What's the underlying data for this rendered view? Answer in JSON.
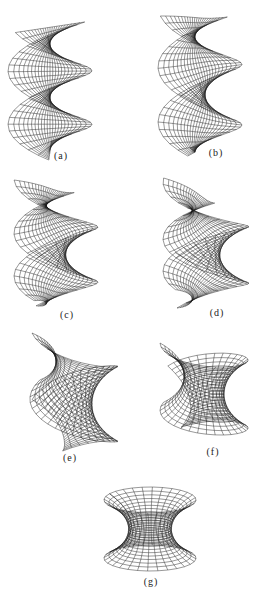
{
  "figure": {
    "panels": [
      {
        "id": "a",
        "label": "(a)",
        "kind": "helicoid",
        "x": 8,
        "y": 22,
        "w": 84,
        "h": 138,
        "flare": 0.0,
        "lx": 61,
        "ly": 150
      },
      {
        "id": "b",
        "label": "(b)",
        "kind": "helicoid",
        "x": 158,
        "y": 16,
        "w": 84,
        "h": 140,
        "flare": 0.15,
        "lx": 216,
        "ly": 147
      },
      {
        "id": "c",
        "label": "(c)",
        "kind": "helicoid",
        "x": 14,
        "y": 180,
        "w": 84,
        "h": 126,
        "flare": 0.3,
        "lx": 67,
        "ly": 309
      },
      {
        "id": "d",
        "label": "(d)",
        "kind": "helicoid",
        "x": 163,
        "y": 178,
        "w": 86,
        "h": 130,
        "flare": 0.45,
        "lx": 217,
        "ly": 307
      },
      {
        "id": "e",
        "label": "(e)",
        "kind": "twisted",
        "x": 30,
        "y": 333,
        "w": 88,
        "h": 118,
        "flare": 0.65,
        "lx": 70,
        "ly": 452
      },
      {
        "id": "f",
        "label": "(f)",
        "kind": "twisted",
        "x": 160,
        "y": 343,
        "w": 88,
        "h": 92,
        "flare": 0.85,
        "lx": 213,
        "ly": 446
      },
      {
        "id": "g",
        "label": "(g)",
        "kind": "catenoid",
        "x": 104,
        "y": 487,
        "w": 92,
        "h": 84,
        "flare": 1.0,
        "lx": 151,
        "ly": 576
      }
    ],
    "colors": {
      "ink": "#1a1a1a",
      "background": "#ffffff"
    }
  }
}
